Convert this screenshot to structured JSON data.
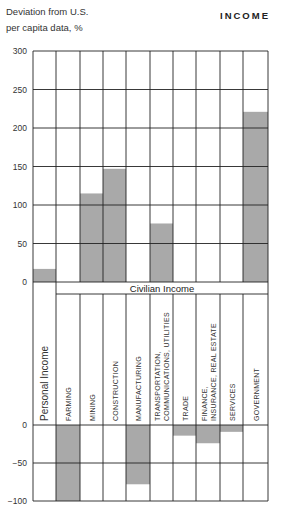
{
  "header": {
    "ylabel_line1": "Deviation from U.S.",
    "ylabel_line2": "per capita data, %",
    "title": "INCOME"
  },
  "band": {
    "label": "Civilian Income"
  },
  "colors": {
    "bar": "#a9a9a9",
    "grid": "#222222",
    "background": "#ffffff"
  },
  "chart_data": {
    "type": "bar",
    "title": "INCOME",
    "ylabel": "Deviation from U.S. per capita data, %",
    "xlabel": "",
    "group_label": "Civilian Income",
    "categories": [
      "Personal Income",
      "FARMING",
      "MINING",
      "CONSTRUCTION",
      "MANUFACTURING",
      "TRANSPORTATION, COMMUNICATIONS, UTILITIES",
      "TRADE",
      "FINANCE, INSURANCE, REAL ESTATE",
      "SERVICES",
      "GOVERNMENT"
    ],
    "values": [
      17,
      -100,
      115,
      147,
      -78,
      76,
      -14,
      -24,
      -9,
      221
    ],
    "upper_panel": {
      "ylim": [
        0,
        300
      ],
      "yticks": [
        0,
        50,
        100,
        150,
        200,
        250,
        300
      ]
    },
    "lower_panel": {
      "ylim": [
        -100,
        0
      ],
      "yticks": [
        0,
        -50,
        -100
      ]
    },
    "grid": true,
    "legend": "none"
  }
}
